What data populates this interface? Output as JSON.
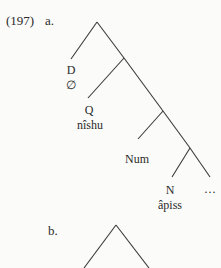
{
  "example": {
    "number": "(197)",
    "parts": [
      {
        "label": "a.",
        "nodes": {
          "d": "D",
          "d_value": "∅",
          "q": "Q",
          "q_value": "nîshu",
          "num": "Num",
          "n": "N",
          "n_value": "âpiss",
          "ellipsis": "…"
        }
      },
      {
        "label": "b."
      }
    ]
  },
  "colors": {
    "ink": "#2a2a2a",
    "paper": "#fbfbf9",
    "bleed_through": "#ecebe7"
  }
}
